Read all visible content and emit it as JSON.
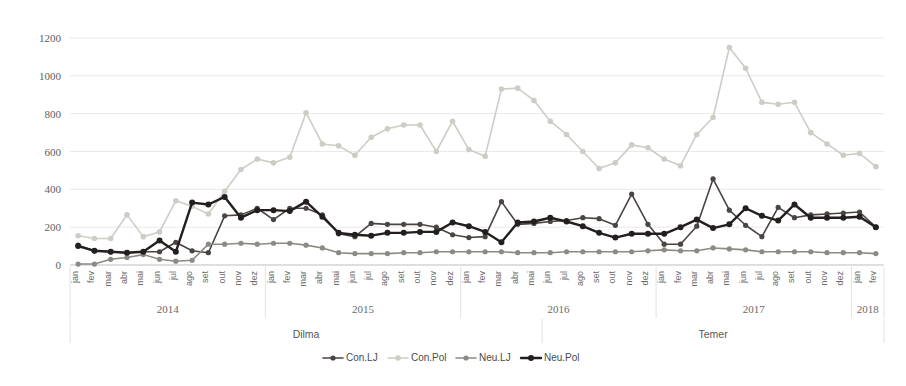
{
  "chart_data": {
    "type": "line",
    "title": "",
    "xlabel": "",
    "ylabel": "",
    "ylim": [
      0,
      1200
    ],
    "ytick_step": 200,
    "yticks": [
      "0",
      "200",
      "400",
      "600",
      "800",
      "1000",
      "1200"
    ],
    "grid": true,
    "legend_position": "bottom",
    "x": [
      "jan",
      "fev",
      "mar",
      "abr",
      "mai",
      "jun",
      "jul",
      "ago",
      "set",
      "out",
      "nov",
      "dez",
      "jan",
      "fev",
      "mar",
      "abr",
      "mai",
      "jun",
      "jul",
      "ago",
      "set",
      "out",
      "nov",
      "dez",
      "jan",
      "fev",
      "mar",
      "abr",
      "mai",
      "jun",
      "jul",
      "ago",
      "set",
      "out",
      "nov",
      "dez",
      "jan",
      "fev",
      "mar",
      "abr",
      "mai",
      "jun",
      "jul",
      "ago",
      "set",
      "out",
      "nov",
      "dez",
      "jan",
      "fev"
    ],
    "year_groups": [
      {
        "label": "2014",
        "start_index": 0,
        "end_index": 11
      },
      {
        "label": "2015",
        "start_index": 12,
        "end_index": 23
      },
      {
        "label": "2016",
        "start_index": 24,
        "end_index": 35
      },
      {
        "label": "2017",
        "start_index": 36,
        "end_index": 47
      },
      {
        "label": "2018",
        "start_index": 48,
        "end_index": 49
      }
    ],
    "period_groups": [
      {
        "label": "Dilma",
        "start_index": 0,
        "end_index": 28
      },
      {
        "label": "Temer",
        "start_index": 29,
        "end_index": 49
      }
    ],
    "series": [
      {
        "name": "Con.LJ",
        "color": "#4a4542",
        "width": 1.6,
        "marker_size": 2.6,
        "values": [
          105,
          75,
          70,
          65,
          70,
          70,
          120,
          75,
          65,
          260,
          265,
          300,
          240,
          300,
          300,
          265,
          165,
          150,
          220,
          215,
          215,
          215,
          200,
          160,
          145,
          150,
          335,
          215,
          220,
          230,
          235,
          250,
          245,
          210,
          375,
          215,
          110,
          110,
          205,
          455,
          290,
          210,
          150,
          305,
          250,
          265,
          270,
          275,
          280,
          200
        ]
      },
      {
        "name": "Con.Pol",
        "color": "#cdcdc6",
        "width": 1.6,
        "marker_size": 2.8,
        "values": [
          155,
          140,
          140,
          265,
          150,
          175,
          340,
          310,
          270,
          390,
          505,
          560,
          540,
          570,
          805,
          640,
          630,
          580,
          675,
          720,
          740,
          740,
          600,
          760,
          610,
          575,
          930,
          935,
          870,
          760,
          690,
          600,
          510,
          540,
          635,
          620,
          560,
          525,
          690,
          780,
          1150,
          1040,
          860,
          850,
          860,
          700,
          640,
          580,
          590,
          520
        ]
      },
      {
        "name": "Neu.LJ",
        "color": "#8b8b85",
        "width": 1.6,
        "marker_size": 2.6,
        "values": [
          5,
          5,
          30,
          40,
          55,
          30,
          20,
          25,
          110,
          110,
          115,
          110,
          115,
          115,
          105,
          90,
          65,
          60,
          60,
          60,
          65,
          65,
          70,
          70,
          70,
          70,
          70,
          65,
          65,
          65,
          70,
          70,
          70,
          70,
          70,
          75,
          80,
          75,
          75,
          90,
          85,
          80,
          70,
          70,
          70,
          70,
          65,
          65,
          65,
          60
        ]
      },
      {
        "name": "Neu.Pol",
        "color": "#231f1e",
        "width": 2.4,
        "marker_size": 3.0,
        "values": [
          100,
          75,
          70,
          65,
          70,
          130,
          70,
          330,
          320,
          360,
          250,
          290,
          290,
          285,
          335,
          255,
          170,
          160,
          155,
          170,
          170,
          175,
          175,
          225,
          205,
          175,
          120,
          225,
          230,
          250,
          230,
          205,
          170,
          145,
          165,
          165,
          165,
          200,
          240,
          195,
          215,
          300,
          260,
          235,
          320,
          250,
          250,
          250,
          255,
          200
        ]
      }
    ]
  },
  "legend": {
    "items": [
      {
        "label": "Con.LJ"
      },
      {
        "label": "Con.Pol"
      },
      {
        "label": "Neu.LJ"
      },
      {
        "label": "Neu.Pol"
      }
    ]
  }
}
